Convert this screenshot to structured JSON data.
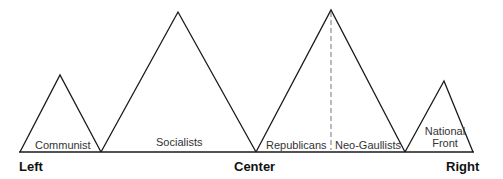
{
  "diagram": {
    "type": "political-spectrum-peaks",
    "stroke_color": "#1a1a1a",
    "axis_labels": {
      "left": "Left",
      "center": "Center",
      "right": "Right"
    },
    "peaks": [
      {
        "id": "communist",
        "label": "Communist"
      },
      {
        "id": "socialists",
        "label": "Socialists"
      },
      {
        "id": "right-center",
        "labels": [
          "Republicans",
          "Neo-Gaullists"
        ],
        "divider": "dashed"
      },
      {
        "id": "national-front",
        "label_line1": "National",
        "label_line2": "Front"
      }
    ]
  }
}
